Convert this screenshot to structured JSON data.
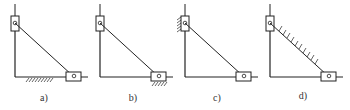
{
  "figure": {
    "panels": [
      {
        "id": "a",
        "label": "a)",
        "offset_x": 0,
        "ground": "horizontal-rod-frame",
        "label_x": 44
      },
      {
        "id": "b",
        "label": "b)",
        "offset_x": 85,
        "ground": "horizontal-slider",
        "label_x": 133
      },
      {
        "id": "c",
        "label": "c)",
        "offset_x": 170,
        "ground": "vertical-slider",
        "label_x": 217
      },
      {
        "id": "d",
        "label": "d)",
        "offset_x": 255,
        "ground": "connecting-link",
        "label_x": 303
      }
    ],
    "colors": {
      "stroke": "#222222",
      "background": "#ffffff"
    }
  }
}
